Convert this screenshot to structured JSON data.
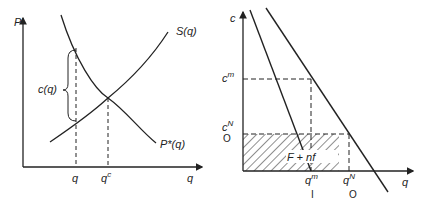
{
  "left_panel": {
    "y_axis_label": "P",
    "x_axis_label": "q",
    "supply_curve_label": "S(q)",
    "demand_curve_label": "P*(q)",
    "gap_label": "c(q)",
    "x_tick_q": "q",
    "x_tick_qc_base": "q",
    "x_tick_qc_sup": "c"
  },
  "right_panel": {
    "y_axis_label": "c",
    "x_axis_label": "q",
    "cm_base": "c",
    "cm_sup": "m",
    "cn_base": "c",
    "cn_sup": "N",
    "cn_sub": "O",
    "qm_base": "q",
    "qm_sup": "m",
    "qm_sub": "I",
    "qn_base": "q",
    "qn_sup": "N",
    "qn_sub": "O",
    "shaded_area_label": "F + nf"
  },
  "colors": {
    "line": "#222222",
    "background": "#ffffff"
  }
}
